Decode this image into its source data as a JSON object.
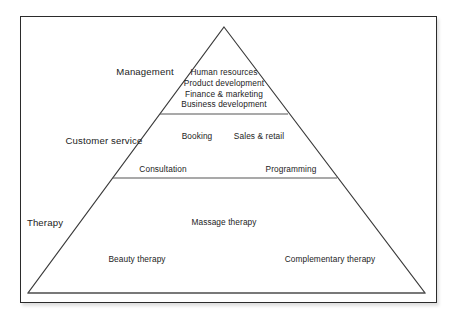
{
  "diagram": {
    "type": "pyramid",
    "shape": {
      "apex": {
        "x": 224,
        "y": 27
      },
      "base_left": {
        "x": 28,
        "y": 293
      },
      "base_right": {
        "x": 425,
        "y": 293
      }
    },
    "frame": {
      "border_color": "#2b2b2b",
      "background_color": "#ffffff"
    },
    "line_color": "#3a3a3a",
    "text_color": "#232323",
    "tiers": [
      {
        "id": "management",
        "label": "Management",
        "label_position": {
          "x": 145,
          "y": 72
        },
        "divider": {
          "y": 114,
          "x_start": 160,
          "x_end": 288
        },
        "items": [
          {
            "text": "Human resources",
            "x": 224,
            "y": 72
          },
          {
            "text": "Product development",
            "x": 224,
            "y": 83
          },
          {
            "text": "Finance & marketing",
            "x": 224,
            "y": 93.5
          },
          {
            "text": "Business development",
            "x": 224,
            "y": 104
          }
        ]
      },
      {
        "id": "customer-service",
        "label": "Customer service",
        "label_position": {
          "x": 104,
          "y": 141
        },
        "divider": {
          "y": 178,
          "x_start": 113,
          "x_end": 337
        },
        "items": [
          {
            "text": "Booking",
            "x": 197,
            "y": 136
          },
          {
            "text": "Sales & retail",
            "x": 259,
            "y": 136
          },
          {
            "text": "Consultation",
            "x": 163,
            "y": 169
          },
          {
            "text": "Programming",
            "x": 291,
            "y": 169
          }
        ]
      },
      {
        "id": "therapy",
        "label": "Therapy",
        "label_position": {
          "x": 45,
          "y": 223
        },
        "divider": null,
        "items": [
          {
            "text": "Massage therapy",
            "x": 224,
            "y": 222
          },
          {
            "text": "Beauty therapy",
            "x": 137,
            "y": 259
          },
          {
            "text": "Complementary therapy",
            "x": 330,
            "y": 259
          }
        ]
      }
    ]
  }
}
